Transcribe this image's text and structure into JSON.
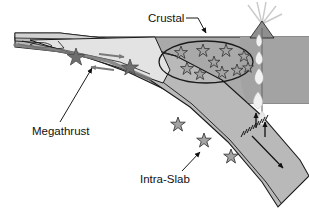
{
  "figure": {
    "name": "subduction-zone-earthquake-diagram",
    "type": "cross-section schematic",
    "width": 309,
    "height": 222,
    "background_color": "#ffffff"
  },
  "labels": [
    {
      "id": "crustal",
      "text": "Crustal",
      "x": 148,
      "y": 22,
      "anchor": "start",
      "leader": {
        "from": [
          187,
          18
        ],
        "to": [
          205,
          36
        ],
        "arrowhead": true
      }
    },
    {
      "id": "megathrust",
      "text": "Megathrust",
      "x": 32,
      "y": 131,
      "anchor": "start",
      "leader": {
        "from": [
          60,
          122
        ],
        "to": [
          92,
          66
        ],
        "arrowhead": true
      }
    },
    {
      "id": "intra-slab",
      "text": "Intra-Slab",
      "x": 143,
      "y": 179,
      "anchor": "start",
      "leader": {
        "from": [
          182,
          171
        ],
        "to": [
          201,
          153
        ],
        "arrowhead": true
      }
    }
  ],
  "colors": {
    "upper_plate": "#a9a9a9",
    "subducting_slab": "#b9b9b9",
    "accretionary_wedge": "#e3e3e3",
    "sediment_layer": "#d2d2d2",
    "mantle_wedge": "#a3a3a3",
    "outline": "#1a1a1a",
    "star_fill_dark": "#6e6e6e",
    "star_fill_light": "#b0b0b0",
    "star_outline": "#3c3c3c",
    "magma_blob": "#f2f2f2",
    "arrow_gray": "#7a7a7a",
    "arrow_black": "#101010",
    "text": "#111111",
    "plume": "#d8d8d8"
  },
  "features": {
    "crustal_ellipse": {
      "name": "crustal-earthquake-zone",
      "cx": 206,
      "cy": 62,
      "rx": 47,
      "ry": 21,
      "star_count": 10
    },
    "crustal_stars": [
      {
        "x": 181,
        "y": 52,
        "r": 6.5
      },
      {
        "x": 203,
        "y": 50,
        "r": 6.5
      },
      {
        "x": 226,
        "y": 50,
        "r": 6.5
      },
      {
        "x": 244,
        "y": 56,
        "r": 6.0
      },
      {
        "x": 214,
        "y": 62,
        "r": 6.0
      },
      {
        "x": 187,
        "y": 68,
        "r": 6.5
      },
      {
        "x": 200,
        "y": 74,
        "r": 6.0
      },
      {
        "x": 222,
        "y": 72,
        "r": 6.5
      },
      {
        "x": 237,
        "y": 70,
        "r": 6.0
      },
      {
        "x": 248,
        "y": 68,
        "r": 5.5
      }
    ],
    "megathrust_stars": [
      {
        "x": 76,
        "y": 57,
        "r": 8.5
      },
      {
        "x": 130,
        "y": 67,
        "r": 8.0
      }
    ],
    "intraslab_stars": [
      {
        "x": 178,
        "y": 124,
        "r": 7.5
      },
      {
        "x": 204,
        "y": 140,
        "r": 7.5
      },
      {
        "x": 231,
        "y": 156,
        "r": 7.5
      }
    ],
    "magma_blobs": [
      {
        "x": 259,
        "y": 40,
        "w": 7,
        "h": 11
      },
      {
        "x": 259,
        "y": 57,
        "w": 7,
        "h": 12
      },
      {
        "x": 259,
        "y": 74,
        "w": 8,
        "h": 14
      },
      {
        "x": 258,
        "y": 98,
        "w": 8,
        "h": 14
      },
      {
        "x": 261,
        "y": 116,
        "w": 7,
        "h": 11
      }
    ],
    "volcano": {
      "name": "volcano-with-eruption-plume",
      "summit_x": 262,
      "summit_y": 22
    },
    "megathrust_arrows": [
      {
        "name": "upper-plate-motion-arrow",
        "from": [
          100,
          55
        ],
        "to": [
          124,
          58
        ],
        "direction": "right"
      },
      {
        "name": "slab-motion-arrow",
        "from": [
          112,
          70
        ],
        "to": [
          90,
          67
        ],
        "direction": "left"
      }
    ],
    "dehydration_arrows": [
      {
        "name": "fluid-ascent-arrow-1",
        "x": 258,
        "y_from": 126,
        "y_to": 112
      },
      {
        "name": "fluid-ascent-arrow-2",
        "x": 266,
        "y_from": 134,
        "y_to": 120
      }
    ],
    "slab_motion_arrow": {
      "name": "slab-descent-arrow",
      "from": [
        254,
        138
      ],
      "to": [
        284,
        170
      ]
    },
    "hatch_marks": {
      "name": "slab-surface-hatch-marks",
      "count": 9,
      "from": [
        241,
        134
      ],
      "to": [
        265,
        119
      ]
    }
  }
}
